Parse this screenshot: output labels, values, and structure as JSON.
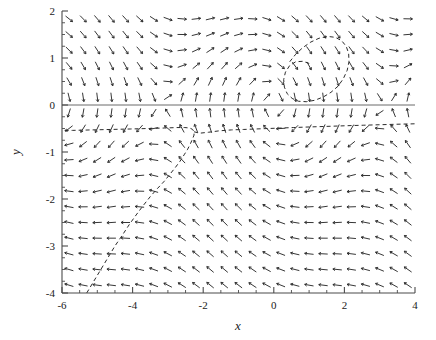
{
  "figure": {
    "width": 436,
    "height": 340,
    "background": "#ffffff",
    "ink_color": "#2b2b2b"
  },
  "chart_data": {
    "type": "scatter",
    "plot_kind": "vector-direction-field",
    "title": "",
    "xlabel": "x",
    "ylabel": "y",
    "xlim": [
      -6,
      4
    ],
    "ylim": [
      -4,
      2
    ],
    "grid": false,
    "legend": null,
    "xticks": [
      -6,
      -4,
      -2,
      0,
      2,
      4
    ],
    "xtick_labels": [
      "-6",
      "-4",
      "-2",
      "0",
      "2",
      "4"
    ],
    "yticks": [
      -4,
      -3,
      -2,
      -1,
      0,
      1,
      2
    ],
    "ytick_labels": [
      "-4",
      "-3",
      "-2",
      "-1",
      "0",
      "1",
      "2"
    ],
    "x_minor_step": 0.5,
    "y_minor_step": 0.25,
    "field": {
      "description": "Normalized direction field of a planar autonomous system drawn as short arrow glyphs on a uniform grid.",
      "grid_nx": 25,
      "grid_ny": 18,
      "glyph_length_px": 9,
      "arrow_head": true,
      "model": {
        "dx": "y",
        "dy": "-sin(x) - 0.35*y"
      }
    },
    "features": [
      {
        "name": "spiral-focus-left",
        "x": -2.4,
        "y": -0.55
      },
      {
        "name": "spiral-focus-right",
        "x": 0.9,
        "y": 0.1
      },
      {
        "name": "horizontal-axis-line",
        "y": 0
      }
    ],
    "trajectory": {
      "style": "dashed",
      "description": "Single solution curve entering from the lower-left corner, rising diagonally and spiralling into the left focus, with a nearly horizontal branch at y = -0.5 extending to the right edge.",
      "points": [
        [
          -5.3,
          -4.0
        ],
        [
          -5.1,
          -3.75
        ],
        [
          -4.9,
          -3.5
        ],
        [
          -4.7,
          -3.25
        ],
        [
          -4.5,
          -3.0
        ],
        [
          -4.3,
          -2.78
        ],
        [
          -4.1,
          -2.55
        ],
        [
          -3.9,
          -2.34
        ],
        [
          -3.7,
          -2.14
        ],
        [
          -3.5,
          -1.95
        ],
        [
          -3.3,
          -1.78
        ],
        [
          -3.1,
          -1.62
        ],
        [
          -2.95,
          -1.48
        ],
        [
          -2.8,
          -1.34
        ],
        [
          -2.66,
          -1.2
        ],
        [
          -2.54,
          -1.06
        ],
        [
          -2.44,
          -0.94
        ],
        [
          -2.36,
          -0.82
        ],
        [
          -2.3,
          -0.72
        ],
        [
          -2.26,
          -0.64
        ],
        [
          -2.26,
          -0.57
        ],
        [
          -2.3,
          -0.52
        ],
        [
          -2.38,
          -0.49
        ],
        [
          -2.52,
          -0.48
        ],
        [
          -2.75,
          -0.48
        ],
        [
          -3.1,
          -0.49
        ],
        [
          -3.55,
          -0.5
        ],
        [
          -4.05,
          -0.51
        ],
        [
          -4.6,
          -0.52
        ],
        [
          -5.15,
          -0.53
        ],
        [
          -5.7,
          -0.54
        ],
        [
          -6.0,
          -0.54
        ]
      ],
      "branch_points": [
        [
          -2.26,
          -0.57
        ],
        [
          -2.1,
          -0.6
        ],
        [
          -1.85,
          -0.58
        ],
        [
          -1.55,
          -0.55
        ],
        [
          -1.2,
          -0.53
        ],
        [
          -0.85,
          -0.52
        ],
        [
          -0.5,
          -0.51
        ],
        [
          -0.15,
          -0.5
        ],
        [
          0.2,
          -0.49
        ],
        [
          0.55,
          -0.48
        ],
        [
          0.9,
          -0.47
        ],
        [
          1.3,
          -0.46
        ],
        [
          1.7,
          -0.45
        ],
        [
          2.1,
          -0.44
        ],
        [
          2.55,
          -0.43
        ],
        [
          3.0,
          -0.42
        ],
        [
          3.45,
          -0.41
        ],
        [
          4.0,
          -0.4
        ]
      ],
      "upper_points": [
        [
          0.45,
          0.92
        ],
        [
          0.62,
          1.08
        ],
        [
          0.82,
          1.22
        ],
        [
          1.05,
          1.34
        ],
        [
          1.28,
          1.42
        ],
        [
          1.52,
          1.46
        ],
        [
          1.74,
          1.44
        ],
        [
          1.92,
          1.37
        ],
        [
          2.05,
          1.25
        ],
        [
          2.12,
          1.1
        ],
        [
          2.13,
          0.92
        ],
        [
          2.08,
          0.74
        ],
        [
          1.97,
          0.56
        ],
        [
          1.82,
          0.4
        ],
        [
          1.62,
          0.27
        ],
        [
          1.4,
          0.17
        ],
        [
          1.16,
          0.1
        ],
        [
          0.92,
          0.07
        ],
        [
          0.7,
          0.08
        ],
        [
          0.52,
          0.14
        ],
        [
          0.38,
          0.24
        ],
        [
          0.3,
          0.38
        ],
        [
          0.28,
          0.54
        ],
        [
          0.33,
          0.7
        ],
        [
          0.45,
          0.84
        ],
        [
          0.62,
          0.92
        ],
        [
          0.82,
          0.93
        ],
        [
          1.02,
          0.88
        ]
      ]
    }
  }
}
